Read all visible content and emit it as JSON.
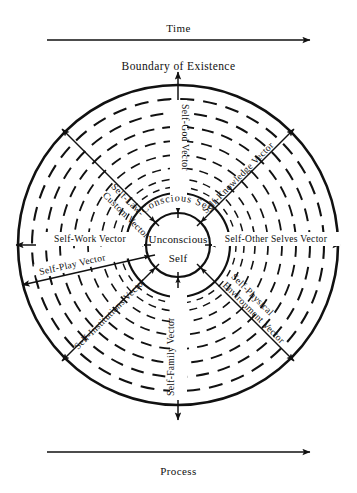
{
  "diagram": {
    "title": "Boundary of Existence",
    "top_axis": {
      "label": "Time",
      "icon": "right-arrow-icon"
    },
    "bottom_axis": {
      "label": "Process",
      "icon": "right-arrow-icon"
    },
    "center": {
      "inner_label_line1": "Unconscious",
      "inner_label_line2": "Self",
      "ring_label": "Conscious Self"
    },
    "rings": {
      "solid_count": 3,
      "dashed_count": 8,
      "inner_radius": 32,
      "conscious_radius": 52,
      "outer_radius": 160
    },
    "vectors": [
      {
        "name": "self-god-vector",
        "label": "Self-God Vector",
        "angle_deg": -90,
        "text_orientation": "down"
      },
      {
        "name": "self-knowledge-vector",
        "label": "Self-Knowledge Vector",
        "angle_deg": -45,
        "text_orientation": "out"
      },
      {
        "name": "self-other-selves-vector",
        "label": "Self-Other Selves Vector",
        "angle_deg": 0,
        "text_orientation": "out"
      },
      {
        "name": "self-physical-environment-vector",
        "label": "Self-Physical Environment Vector",
        "angle_deg": 45,
        "text_orientation": "out"
      },
      {
        "name": "self-family-vector",
        "label": "Self-Family Vector",
        "angle_deg": 90,
        "text_orientation": "up"
      },
      {
        "name": "self-institutions-vector",
        "label": "Self-Institutions Vector",
        "angle_deg": 135,
        "text_orientation": "in"
      },
      {
        "name": "self-play-vector",
        "label": "Self-Play Vector",
        "angle_deg": 160,
        "text_orientation": "in"
      },
      {
        "name": "self-work-vector",
        "label": "Self-Work Vector",
        "angle_deg": 180,
        "text_orientation": "in"
      },
      {
        "name": "self-law-custom-vector",
        "label": "Self-Law-Custom Vector",
        "angle_deg": -135,
        "text_orientation": "in"
      }
    ],
    "colors": {
      "stroke": "#111111",
      "background": "#ffffff",
      "text": "#111111"
    }
  }
}
